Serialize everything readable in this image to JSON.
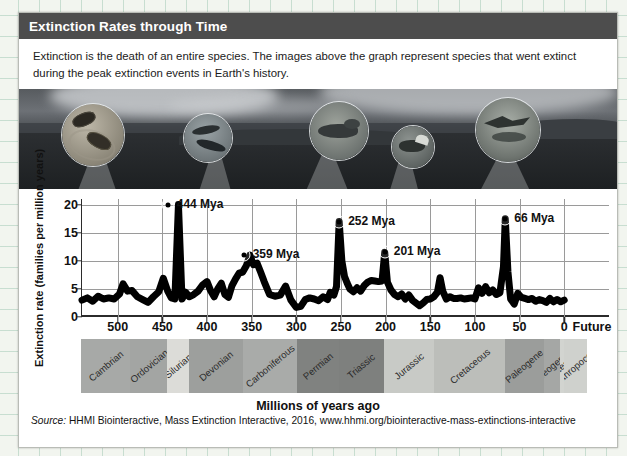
{
  "card": {
    "title": "Extinction Rates through Time",
    "intro": "Extinction is the death of an entire species. The images above the graph represent species that went extinct during the peak extinction events in Earth's history.",
    "source_prefix": "Source:",
    "source": "HHMI Biointeractive, Mass Extinction Interactive, 2016, www.hhmi.org/biointeractive-mass-extinctions-interactive"
  },
  "photo": {
    "lenses": [
      {
        "name": "trilobites-inset",
        "label": "trilobites"
      },
      {
        "name": "fish-inset",
        "label": "armored fish"
      },
      {
        "name": "reptile-inset",
        "label": "synapsid reptile"
      },
      {
        "name": "dinosaur-inset",
        "label": "armored dinosaur"
      },
      {
        "name": "pterosaur-inset",
        "label": "pterosaur"
      }
    ]
  },
  "chart_data": {
    "type": "line",
    "title": "Extinction Rates through Time",
    "xlabel": "Millions of years ago",
    "ylabel": "Extinction rate (families per million years)",
    "xlim": [
      540,
      0
    ],
    "ylim": [
      0,
      21
    ],
    "x_ticks": [
      500,
      450,
      400,
      350,
      300,
      250,
      200,
      150,
      100,
      50,
      0
    ],
    "x_extra_tick_label": "Future",
    "y_ticks": [
      0,
      5,
      10,
      15,
      20
    ],
    "grid": "horizontal-and-vertical",
    "legend": "none",
    "annotations": [
      {
        "label": "444 Mya",
        "x": 444,
        "y": 20.0
      },
      {
        "label": "359 Mya",
        "x": 359,
        "y": 11.0
      },
      {
        "label": "252 Mya",
        "x": 252,
        "y": 17.0
      },
      {
        "label": "201 Mya",
        "x": 201,
        "y": 11.5
      },
      {
        "label": "66 Mya",
        "x": 66,
        "y": 17.5
      }
    ],
    "series": [
      {
        "name": "Extinction rate",
        "points": [
          [
            540,
            3.0
          ],
          [
            534,
            3.4
          ],
          [
            528,
            2.8
          ],
          [
            522,
            3.7
          ],
          [
            516,
            3.2
          ],
          [
            510,
            3.4
          ],
          [
            504,
            3.2
          ],
          [
            498,
            4.1
          ],
          [
            494,
            5.9
          ],
          [
            489,
            4.6
          ],
          [
            484,
            4.7
          ],
          [
            478,
            3.6
          ],
          [
            472,
            3.1
          ],
          [
            466,
            2.6
          ],
          [
            460,
            3.6
          ],
          [
            454,
            4.5
          ],
          [
            449,
            6.9
          ],
          [
            444,
            4.6
          ],
          [
            440,
            3.4
          ],
          [
            436,
            3.2
          ],
          [
            432,
            20.0
          ],
          [
            428,
            3.2
          ],
          [
            424,
            4.4
          ],
          [
            420,
            3.6
          ],
          [
            415,
            4.0
          ],
          [
            410,
            4.6
          ],
          [
            405,
            5.7
          ],
          [
            400,
            6.3
          ],
          [
            396,
            4.7
          ],
          [
            392,
            3.6
          ],
          [
            388,
            5.0
          ],
          [
            384,
            6.0
          ],
          [
            380,
            4.0
          ],
          [
            376,
            3.5
          ],
          [
            372,
            5.6
          ],
          [
            368,
            6.8
          ],
          [
            364,
            7.8
          ],
          [
            360,
            8.0
          ],
          [
            356,
            9.1
          ],
          [
            352,
            11.0
          ],
          [
            348,
            9.3
          ],
          [
            344,
            9.6
          ],
          [
            340,
            8.0
          ],
          [
            336,
            6.3
          ],
          [
            330,
            4.0
          ],
          [
            324,
            3.7
          ],
          [
            318,
            3.9
          ],
          [
            312,
            5.5
          ],
          [
            306,
            3.0
          ],
          [
            300,
            1.7
          ],
          [
            295,
            1.9
          ],
          [
            290,
            3.1
          ],
          [
            285,
            3.4
          ],
          [
            280,
            3.2
          ],
          [
            275,
            2.9
          ],
          [
            270,
            3.6
          ],
          [
            265,
            3.1
          ],
          [
            262,
            4.4
          ],
          [
            258,
            3.9
          ],
          [
            255,
            5.4
          ],
          [
            252,
            17.0
          ],
          [
            249,
            10.0
          ],
          [
            246,
            7.2
          ],
          [
            243,
            6.0
          ],
          [
            240,
            5.0
          ],
          [
            236,
            4.5
          ],
          [
            232,
            5.2
          ],
          [
            228,
            4.6
          ],
          [
            224,
            5.6
          ],
          [
            220,
            6.2
          ],
          [
            216,
            6.5
          ],
          [
            212,
            6.4
          ],
          [
            208,
            6.3
          ],
          [
            204,
            6.4
          ],
          [
            201,
            11.5
          ],
          [
            198,
            6.2
          ],
          [
            194,
            4.8
          ],
          [
            190,
            4.0
          ],
          [
            186,
            3.6
          ],
          [
            182,
            4.1
          ],
          [
            178,
            3.2
          ],
          [
            174,
            3.9
          ],
          [
            170,
            3.0
          ],
          [
            166,
            2.5
          ],
          [
            162,
            2.0
          ],
          [
            158,
            2.5
          ],
          [
            154,
            3.1
          ],
          [
            150,
            3.2
          ],
          [
            146,
            3.6
          ],
          [
            142,
            4.4
          ],
          [
            139,
            7.0
          ],
          [
            136,
            4.6
          ],
          [
            132,
            3.2
          ],
          [
            128,
            3.6
          ],
          [
            124,
            3.3
          ],
          [
            120,
            3.3
          ],
          [
            116,
            3.4
          ],
          [
            112,
            3.2
          ],
          [
            108,
            3.3
          ],
          [
            104,
            3.4
          ],
          [
            100,
            3.2
          ],
          [
            96,
            5.2
          ],
          [
            92,
            4.2
          ],
          [
            88,
            5.4
          ],
          [
            84,
            4.3
          ],
          [
            80,
            4.8
          ],
          [
            76,
            4.0
          ],
          [
            72,
            4.3
          ],
          [
            68,
            9.0
          ],
          [
            66,
            17.5
          ],
          [
            63,
            8.0
          ],
          [
            60,
            3.2
          ],
          [
            56,
            2.3
          ],
          [
            52,
            4.2
          ],
          [
            48,
            3.5
          ],
          [
            44,
            3.3
          ],
          [
            40,
            3.1
          ],
          [
            36,
            3.3
          ],
          [
            32,
            2.8
          ],
          [
            28,
            3.1
          ],
          [
            24,
            2.9
          ],
          [
            20,
            2.6
          ],
          [
            16,
            3.3
          ],
          [
            12,
            2.7
          ],
          [
            8,
            3.1
          ],
          [
            4,
            2.7
          ],
          [
            0,
            3.0
          ]
        ]
      }
    ]
  },
  "periods": [
    {
      "name": "Cambrian",
      "start": 541,
      "end": 485,
      "shade": "#a7a9a7"
    },
    {
      "name": "Ordovician",
      "start": 485,
      "end": 444,
      "shade": "#a3a5a3"
    },
    {
      "name": "Silurian",
      "start": 444,
      "end": 419,
      "shade": "#dcdcd8"
    },
    {
      "name": "Devonian",
      "start": 419,
      "end": 359,
      "shade": "#9d9f9d"
    },
    {
      "name": "Carboniferous",
      "start": 359,
      "end": 299,
      "shade": "#a9aba9"
    },
    {
      "name": "Permian",
      "start": 299,
      "end": 252,
      "shade": "#808280"
    },
    {
      "name": "Triassic",
      "start": 252,
      "end": 201,
      "shade": "#7e807e"
    },
    {
      "name": "Jurassic",
      "start": 201,
      "end": 145,
      "shade": "#c8cac6"
    },
    {
      "name": "Cretaceous",
      "start": 145,
      "end": 66,
      "shade": "#bcbeba"
    },
    {
      "name": "Paleogene",
      "start": 66,
      "end": 23,
      "shade": "#9b9d9b"
    },
    {
      "name": "Neogene",
      "start": 23,
      "end": 5,
      "shade": "#a5a7a5"
    },
    {
      "name": "Quaternary",
      "start": 5,
      "end": 0,
      "shade": "#d2d4d0"
    },
    {
      "name": "Anthropocene",
      "start": 0,
      "end": -26,
      "shade": "#cfd1cd"
    }
  ]
}
